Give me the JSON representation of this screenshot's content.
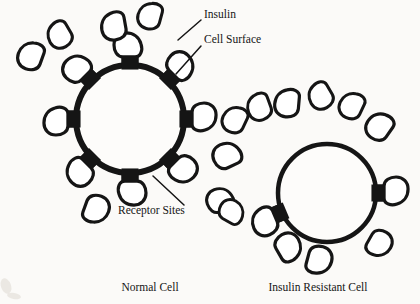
{
  "figure": {
    "background_color": "#fbfaf8",
    "ink_color": "#151515",
    "width": 420,
    "height": 304
  },
  "annotations": [
    {
      "id": "insulin",
      "label": "Insulin",
      "x": 204,
      "y": 15,
      "font_size": 11.5,
      "leader": {
        "x1": 201,
        "y1": 20,
        "x2": 178,
        "y2": 40
      }
    },
    {
      "id": "cell-surface",
      "label": "Cell Surface",
      "x": 204,
      "y": 40,
      "font_size": 11.5,
      "leader": {
        "x1": 201,
        "y1": 46,
        "x2": 176,
        "y2": 74
      }
    },
    {
      "id": "receptor-sites",
      "label": "Receptor Sites",
      "x": 118,
      "y": 211,
      "font_size": 11.5,
      "leader": {
        "x1": 184,
        "y1": 205,
        "x2": 153,
        "y2": 176
      }
    }
  ],
  "captions": [
    {
      "id": "normal-cell",
      "label": "Normal Cell",
      "x": 150,
      "y": 288,
      "font_size": 11.5
    },
    {
      "id": "insulin-resistant-cell",
      "label": "Insulin Resistant Cell",
      "x": 318,
      "y": 288,
      "font_size": 11.5
    }
  ],
  "cells": [
    {
      "id": "normal-cell",
      "name": "Normal Cell",
      "cx": 130,
      "cy": 119,
      "r": 54,
      "stroke_width": 6,
      "receptor_count": 8,
      "bound_insulin_count": 8,
      "free_insulin_count": 5,
      "receptors": [
        {
          "angle": -90,
          "bound": true
        },
        {
          "angle": -45,
          "bound": true
        },
        {
          "angle": 0,
          "bound": true
        },
        {
          "angle": 45,
          "bound": true
        },
        {
          "angle": 90,
          "bound": true
        },
        {
          "angle": 135,
          "bound": true
        },
        {
          "angle": 180,
          "bound": true
        },
        {
          "angle": -135,
          "bound": true
        }
      ]
    },
    {
      "id": "insulin-resistant-cell",
      "name": "Insulin Resistant Cell",
      "cx": 327,
      "cy": 193,
      "r": 49,
      "stroke_width": 4.5,
      "receptor_count": 2,
      "bound_insulin_count": 2,
      "free_insulin_count": 12,
      "receptors": [
        {
          "angle": 0,
          "bound": true
        },
        {
          "angle": 157,
          "bound": true
        }
      ]
    }
  ],
  "free_insulin": [
    {
      "cell": "normal-cell",
      "x": 32,
      "y": 54,
      "rot": 200,
      "scale": 1.0
    },
    {
      "cell": "normal-cell",
      "x": 59,
      "y": 33,
      "rot": 150,
      "scale": 0.95
    },
    {
      "cell": "normal-cell",
      "x": 114,
      "y": 24,
      "rot": 170,
      "scale": 1.0
    },
    {
      "cell": "normal-cell",
      "x": 151,
      "y": 14,
      "rot": 195,
      "scale": 0.95
    },
    {
      "cell": "normal-cell",
      "x": 95,
      "y": 211,
      "rot": 20,
      "scale": 1.0
    },
    {
      "cell": "insulin-resistant-cell",
      "x": 236,
      "y": 118,
      "rot": 205,
      "scale": 0.95
    },
    {
      "cell": "insulin-resistant-cell",
      "x": 259,
      "y": 105,
      "rot": 160,
      "scale": 0.95
    },
    {
      "cell": "insulin-resistant-cell",
      "x": 288,
      "y": 101,
      "rot": 185,
      "scale": 1.0
    },
    {
      "cell": "insulin-resistant-cell",
      "x": 320,
      "y": 94,
      "rot": 150,
      "scale": 0.95
    },
    {
      "cell": "insulin-resistant-cell",
      "x": 353,
      "y": 104,
      "rot": 205,
      "scale": 0.95
    },
    {
      "cell": "insulin-resistant-cell",
      "x": 381,
      "y": 125,
      "rot": 215,
      "scale": 1.0
    },
    {
      "cell": "insulin-resistant-cell",
      "x": 229,
      "y": 155,
      "rot": 245,
      "scale": 1.0
    },
    {
      "cell": "insulin-resistant-cell",
      "x": 222,
      "y": 200,
      "rot": 250,
      "scale": 0.95
    },
    {
      "cell": "insulin-resistant-cell",
      "x": 233,
      "y": 213,
      "rot": 300,
      "scale": 0.9
    },
    {
      "cell": "insulin-resistant-cell",
      "x": 289,
      "y": 249,
      "rot": 330,
      "scale": 1.0
    },
    {
      "cell": "insulin-resistant-cell",
      "x": 318,
      "y": 262,
      "rot": 15,
      "scale": 1.0
    },
    {
      "cell": "insulin-resistant-cell",
      "x": 378,
      "y": 245,
      "rot": 30,
      "scale": 0.95
    }
  ],
  "shape_defs": {
    "insulin_blob_path": "M -11 -7 C -11 -13 -5 -16 1 -16 C 8 -16 13 -11 13 -4 C 13 3 9 9 2 11 C -4 13 -11 11 -11 5 Z",
    "insulin_blob_width": 26,
    "insulin_blob_stroke": 3.2,
    "receptor_width": 17,
    "receptor_depth": 13
  },
  "smudges": [
    {
      "x": 6,
      "y": 286,
      "rx": 5,
      "ry": 8,
      "rot": -20
    },
    {
      "x": 14,
      "y": 296,
      "rx": 7,
      "ry": 3,
      "rot": 10
    }
  ]
}
